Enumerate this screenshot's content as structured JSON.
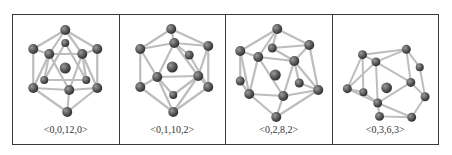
{
  "figure": {
    "panels": [
      {
        "label": "<0,0,12,0>",
        "structure": "icosahedral-cluster"
      },
      {
        "label": "<0,1,10,2>",
        "structure": "distorted-icosahedral-cluster"
      },
      {
        "label": "<0,2,8,2>",
        "structure": "distorted-icosahedral-cluster"
      },
      {
        "label": "<0,3,6,3>",
        "structure": "distorted-cluster"
      }
    ]
  },
  "colors": {
    "atom": "#5a5a5a",
    "bond": "#c8c8c8",
    "border": "#3a3a3a",
    "text": "#333333"
  }
}
